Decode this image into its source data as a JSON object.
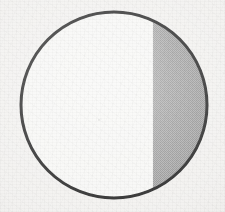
{
  "figure": {
    "kind": "geometry-diagram",
    "medium": "scanned textbook page",
    "canvas": {
      "width": 225,
      "height": 212
    },
    "labels": [],
    "caption": "",
    "title": ""
  },
  "colors": {
    "page_background": "#f2f1ef",
    "circle_interior": "#f7f7f5",
    "outline": "#1a1a1a",
    "segment_fill": "#a8a8a8",
    "segment_dither_dark": "#8e8e8e",
    "segment_dither_light": "#c2c2c2"
  },
  "chart_data": {
    "type": "pie",
    "title": "",
    "xlabel": "",
    "ylabel": "",
    "categories": [
      "Shaded segment",
      "Unshaded region"
    ],
    "values": [
      19,
      81
    ],
    "legend_position": "none",
    "grid": false,
    "annotations": [],
    "geometry": {
      "shape": "circle",
      "center_x": 114,
      "center_y": 105,
      "radius": 94,
      "outline_width": 3,
      "chord": {
        "orientation": "vertical",
        "x": 153,
        "top_intersection_y": 22,
        "bottom_intersection_y": 188,
        "half_length": 83,
        "distance_from_center": 39,
        "drawn_as": "fill-boundary"
      },
      "shaded_region": {
        "name": "minor-circular-segment",
        "side": "right",
        "fill_style": "halftone-dither",
        "area_fraction": 0.19
      }
    }
  }
}
